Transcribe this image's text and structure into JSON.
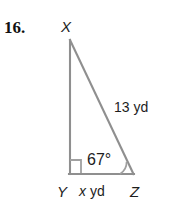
{
  "problem": {
    "number": "16."
  },
  "figure": {
    "type": "right-triangle",
    "vertices": {
      "apex_label": "X",
      "right_angle_label": "Y",
      "base_right_label": "Z"
    },
    "labels": {
      "hypotenuse": "13 yd",
      "base_variable": "x",
      "base_unit": "yd",
      "angle_at_z": "67°"
    },
    "markers": {
      "right_angle_at": "Y",
      "angle_arc_at": "Z"
    },
    "colors": {
      "stroke": "#8f8f8f",
      "text": "#1d1d1d",
      "background": "#ffffff"
    }
  }
}
